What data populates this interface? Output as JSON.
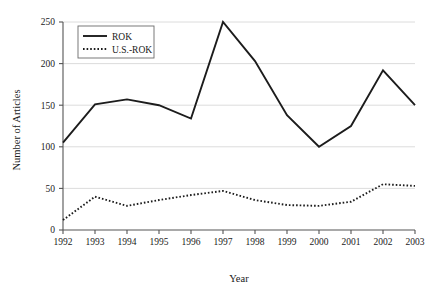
{
  "chart_data": {
    "type": "line",
    "title": "",
    "xlabel": "Year",
    "ylabel": "Number of Articles",
    "categories": [
      "1992",
      "1993",
      "1994",
      "1995",
      "1996",
      "1997",
      "1998",
      "1999",
      "2000",
      "2001",
      "2002",
      "2003"
    ],
    "x": [
      1992,
      1993,
      1994,
      1995,
      1996,
      1997,
      1998,
      1999,
      2000,
      2001,
      2002,
      2003
    ],
    "xlim": [
      1992,
      2003
    ],
    "ylim": [
      0,
      250
    ],
    "yticks": [
      0,
      50,
      100,
      150,
      200,
      250
    ],
    "ytick_labels": [
      "0",
      "50",
      "100",
      "150",
      "200",
      "250"
    ],
    "xtick_labels": [
      "1992",
      "1993",
      "1994",
      "1995",
      "1996",
      "1997",
      "1998",
      "1999",
      "2000",
      "2001",
      "2002",
      "2003"
    ],
    "grid": "horizontal",
    "legend_position": "top-left",
    "series": [
      {
        "name": "ROK",
        "style": "solid",
        "color": "#1c1c1c",
        "values": [
          105,
          151,
          157,
          150,
          134,
          250,
          203,
          138,
          100,
          125,
          192,
          150
        ]
      },
      {
        "name": "U.S.-ROK",
        "style": "dotted",
        "color": "#1c1c1c",
        "values": [
          12,
          40,
          29,
          36,
          42,
          47,
          36,
          30,
          29,
          34,
          55,
          53
        ]
      }
    ]
  },
  "legend": {
    "entries": [
      {
        "label": "ROK",
        "style": "solid"
      },
      {
        "label": "U.S.-ROK",
        "style": "dotted"
      }
    ]
  },
  "axes": {
    "y_title": "Number of Articles",
    "x_title": "Year"
  }
}
